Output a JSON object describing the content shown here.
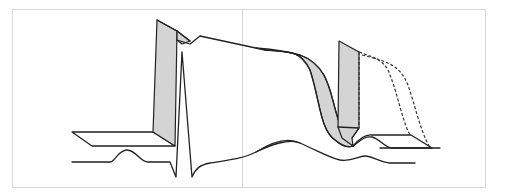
{
  "figure": {
    "colors": {
      "line": "#222222",
      "ribbon_fill": "#d4d4d4",
      "frame": "#d8d8d8",
      "background": "#ffffff"
    },
    "elements": [
      "action-potential-ribbon",
      "upstroke-face",
      "plateau",
      "repolarization-ribbon",
      "second-upstroke-face",
      "dashed-prolonged-repolarization",
      "ecg-trace",
      "p-wave",
      "qrs-complex",
      "t-wave"
    ]
  }
}
